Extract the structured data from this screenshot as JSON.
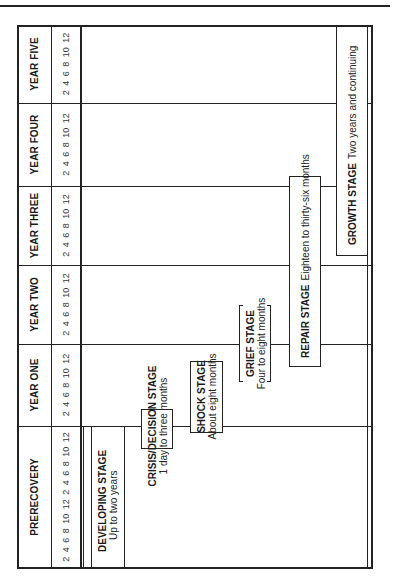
{
  "orientation": "rotated-90-ccw",
  "timeline": {
    "periods": [
      {
        "label": "PRERECOVERY",
        "ticks": "2 4 6 8 10 12 2 4 6 8 10 12"
      },
      {
        "label": "YEAR ONE",
        "ticks": "2 4 6 8 10 12"
      },
      {
        "label": "YEAR TWO",
        "ticks": "2 4 6 8 10 12"
      },
      {
        "label": "YEAR THREE",
        "ticks": "2 4 6 8 10 12"
      },
      {
        "label": "YEAR FOUR",
        "ticks": "2 4 6 8 10 12"
      },
      {
        "label": "YEAR FIVE",
        "ticks": "2 4 6 8 10 12"
      }
    ]
  },
  "stages": {
    "developing": {
      "title": "DEVELOPING STAGE",
      "duration": "Up to two years"
    },
    "crisis": {
      "title": "CRISIS/DECISION STAGE",
      "duration": "1 day to three months"
    },
    "shock": {
      "title": "SHOCK STAGE",
      "duration": "About eight months"
    },
    "grief": {
      "title": "GRIEF STAGE",
      "duration": "Four to eight months"
    },
    "repair": {
      "title": "REPAIR STAGE",
      "duration": "Eighteen to thirty-six months"
    },
    "growth": {
      "title": "GROWTH STAGE",
      "duration": "Two years and continuing"
    }
  }
}
